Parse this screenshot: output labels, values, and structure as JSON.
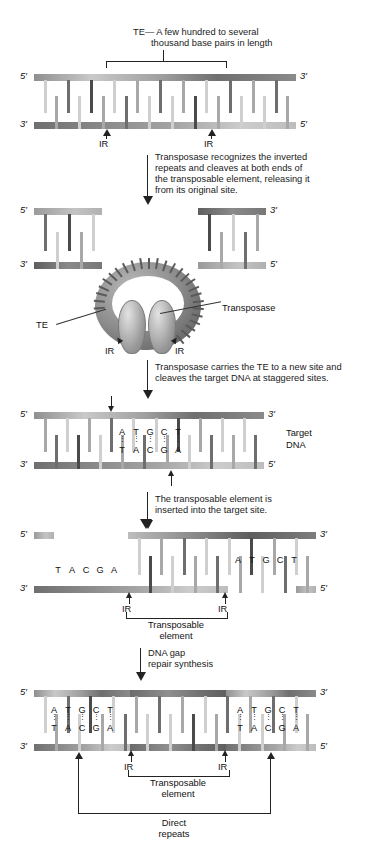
{
  "figure": {
    "type": "biology-diagram"
  },
  "labels": {
    "five_prime": "5′",
    "three_prime": "3′",
    "ir": "IR",
    "te": "TE",
    "transposase": "Transposase",
    "target_dna_line1": "Target",
    "target_dna_line2": "DNA",
    "transposable_line1": "Transposable",
    "transposable_line2": "element",
    "direct_line1": "Direct",
    "direct_line2": "repeats"
  },
  "captions": {
    "te_length_line1": "TE— A few hundred to several",
    "te_length_line2": "thousand base pairs in length",
    "step1_line1": "Transposase recognizes the inverted",
    "step1_line2": "repeats and cleaves at both ends of",
    "step1_line3": "the transposable element, releasing it",
    "step1_line4": "from its original site.",
    "step2_line1": "Transposase carries the TE to a new site and",
    "step2_line2": "cleaves the target DNA at staggered sites.",
    "step3_line1": "The transposable element is",
    "step3_line2": "inserted into the target site.",
    "step4_line1": "DNA gap",
    "step4_line2": "repair synthesis"
  },
  "target_site_bases": {
    "top": [
      "A",
      "T",
      "G",
      "C",
      "T"
    ],
    "bottom": [
      "T",
      "A",
      "C",
      "G",
      "A"
    ],
    "pair_dot": "⋮"
  },
  "inserted_bases": {
    "left_bottom_strand": [
      "T",
      "A",
      "C",
      "G",
      "A"
    ],
    "right_top_strand": [
      "A",
      "T",
      "G",
      "C",
      "T"
    ]
  },
  "direct_repeat_bases": {
    "left_top": [
      "A",
      "T",
      "G",
      "C",
      "T"
    ],
    "left_bottom": [
      "T",
      "A",
      "C",
      "G",
      "A"
    ],
    "right_top": [
      "A",
      "T",
      "G",
      "C",
      "T"
    ],
    "right_bottom": [
      "T",
      "A",
      "C",
      "G",
      "A"
    ]
  },
  "colors": {
    "ink": "#111111",
    "backbone_light": "#c9c9c9",
    "backbone_mid": "#8f8f8f",
    "backbone_dark": "#5e5e5e",
    "rung_light": "#cfcfcf",
    "rung_dark": "#6e6e6e",
    "background": "#ffffff"
  }
}
